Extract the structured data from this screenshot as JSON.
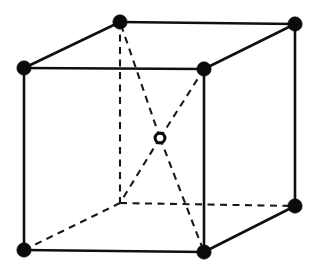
{
  "figure": {
    "background_color": "#ffffff",
    "line_color": "#101010",
    "corner_atom_color": "#0b0b0b",
    "center_atom_fill": "#ffffff",
    "center_atom_stroke": "#0b0b0b",
    "width": 314,
    "height": 274
  },
  "geometry": {
    "corner_atom_radius": 7.2,
    "center_atom_outer_radius": 6.4,
    "center_atom_inner_radius": 3.4,
    "solid_edge_width": 2.6,
    "hidden_edge_width": 2.1,
    "hidden_dash_pattern": "7 5.5"
  },
  "vertices": [
    {
      "id": "front-top-left",
      "label": "Front Top Left",
      "x": 24,
      "y": 68,
      "visible": true,
      "atom": "filled"
    },
    {
      "id": "front-top-right",
      "label": "Front Top Right",
      "x": 204,
      "y": 69,
      "visible": true,
      "atom": "filled"
    },
    {
      "id": "front-bottom-right",
      "label": "Front Bottom Right",
      "x": 204,
      "y": 252,
      "visible": true,
      "atom": "filled"
    },
    {
      "id": "front-bottom-left",
      "label": "Front Bottom Left",
      "x": 24,
      "y": 250,
      "visible": true,
      "atom": "filled"
    },
    {
      "id": "back-top-left",
      "label": "Back Top Left",
      "x": 120,
      "y": 22,
      "visible": true,
      "atom": "filled"
    },
    {
      "id": "back-top-right",
      "label": "Back Top Right",
      "x": 295,
      "y": 24,
      "visible": true,
      "atom": "filled"
    },
    {
      "id": "back-bottom-right",
      "label": "Back Bottom Right",
      "x": 295,
      "y": 206,
      "visible": true,
      "atom": "filled"
    },
    {
      "id": "back-bottom-left",
      "label": "Back Bottom Left",
      "x": 120,
      "y": 203,
      "visible": false,
      "atom": "none"
    }
  ],
  "center_atom": {
    "id": "body-center",
    "label": "Body Center Atom",
    "x": 160,
    "y": 138,
    "atom": "open"
  },
  "edges_solid": [
    {
      "id": "edge-front-top",
      "from": "front-top-left",
      "to": "front-top-right",
      "x1": 24,
      "y1": 68,
      "x2": 204,
      "y2": 69
    },
    {
      "id": "edge-front-right",
      "from": "front-top-right",
      "to": "front-bottom-right",
      "x1": 204,
      "y1": 69,
      "x2": 204,
      "y2": 252
    },
    {
      "id": "edge-front-bottom",
      "from": "front-bottom-right",
      "to": "front-bottom-left",
      "x1": 204,
      "y1": 252,
      "x2": 24,
      "y2": 250
    },
    {
      "id": "edge-front-left",
      "from": "front-bottom-left",
      "to": "front-top-left",
      "x1": 24,
      "y1": 250,
      "x2": 24,
      "y2": 68
    },
    {
      "id": "edge-back-top",
      "from": "back-top-left",
      "to": "back-top-right",
      "x1": 120,
      "y1": 22,
      "x2": 295,
      "y2": 24
    },
    {
      "id": "edge-back-right",
      "from": "back-top-right",
      "to": "back-bottom-right",
      "x1": 295,
      "y1": 24,
      "x2": 295,
      "y2": 206
    },
    {
      "id": "edge-top-left-depth",
      "from": "front-top-left",
      "to": "back-top-left",
      "x1": 24,
      "y1": 68,
      "x2": 120,
      "y2": 22
    },
    {
      "id": "edge-top-right-depth",
      "from": "front-top-right",
      "to": "back-top-right",
      "x1": 204,
      "y1": 69,
      "x2": 295,
      "y2": 24
    },
    {
      "id": "edge-bottom-right-depth",
      "from": "front-bottom-right",
      "to": "back-bottom-right",
      "x1": 204,
      "y1": 252,
      "x2": 295,
      "y2": 206
    }
  ],
  "edges_hidden": [
    {
      "id": "edge-back-left",
      "from": "back-top-left",
      "to": "back-bottom-left",
      "x1": 120,
      "y1": 22,
      "x2": 120,
      "y2": 203
    },
    {
      "id": "edge-back-bottom",
      "from": "back-bottom-left",
      "to": "back-bottom-right",
      "x1": 120,
      "y1": 203,
      "x2": 295,
      "y2": 206
    },
    {
      "id": "edge-bottom-left-depth",
      "from": "front-bottom-left",
      "to": "back-bottom-left",
      "x1": 24,
      "y1": 250,
      "x2": 120,
      "y2": 203
    }
  ],
  "diagonals_hidden": [
    {
      "id": "diagonal-center-back-top-left",
      "from": "body-center",
      "to": "back-top-left",
      "x1": 160,
      "y1": 138,
      "x2": 120,
      "y2": 22
    },
    {
      "id": "diagonal-center-front-top-right",
      "from": "body-center",
      "to": "front-top-right",
      "x1": 160,
      "y1": 138,
      "x2": 204,
      "y2": 69
    },
    {
      "id": "diagonal-center-back-bottom-left",
      "from": "body-center",
      "to": "back-bottom-left",
      "x1": 160,
      "y1": 138,
      "x2": 120,
      "y2": 203
    },
    {
      "id": "diagonal-center-front-bottom-right",
      "from": "body-center",
      "to": "front-bottom-right",
      "x1": 160,
      "y1": 138,
      "x2": 204,
      "y2": 252
    }
  ]
}
